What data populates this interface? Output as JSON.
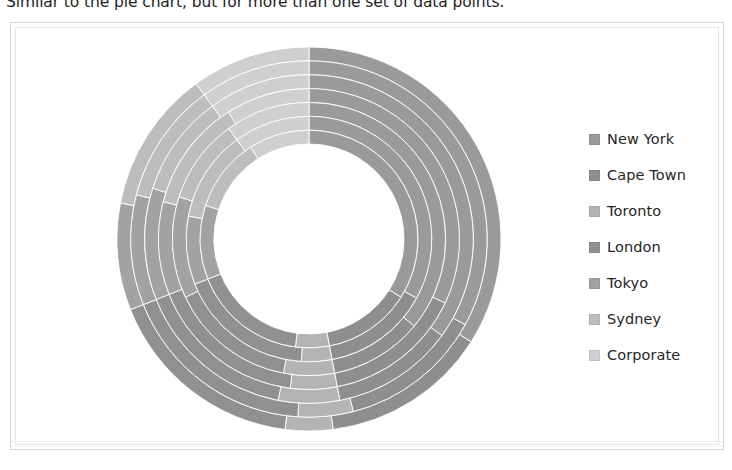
{
  "caption": {
    "text": "Similar to the pie chart, but for more than one set of data points."
  },
  "figure": {
    "frame_color": "#d8d8d8",
    "background": "#ffffff"
  },
  "legend": {
    "position": "right",
    "items": [
      {
        "label": "New York",
        "color": "#9a9a9a"
      },
      {
        "label": "Cape Town",
        "color": "#8e8e8e"
      },
      {
        "label": "Toronto",
        "color": "#b4b4b4"
      },
      {
        "label": "London",
        "color": "#909090"
      },
      {
        "label": "Tokyo",
        "color": "#a2a2a2"
      },
      {
        "label": "Sydney",
        "color": "#bdbdbd"
      },
      {
        "label": "Corporate",
        "color": "#cfcfcf"
      }
    ]
  },
  "chart_data": {
    "type": "pie",
    "subtype": "multi-ring-doughnut",
    "title": "",
    "xlabel": "",
    "ylabel": "",
    "grid": false,
    "legend_position": "right",
    "start_angle_deg": -90,
    "direction": "clockwise",
    "center": {
      "x": 200,
      "y": 200
    },
    "inner_radius": 95,
    "outer_radius": 192,
    "ring_count": 7,
    "categories": [
      "New York",
      "Cape Town",
      "Toronto",
      "London",
      "Tokyo",
      "Sydney",
      "Corporate"
    ],
    "colors": [
      "#9a9a9a",
      "#8e8e8e",
      "#b4b4b4",
      "#909090",
      "#a2a2a2",
      "#bdbdbd",
      "#cfcfcf"
    ],
    "rings": [
      {
        "name": "Ring 1 (outermost)",
        "r_inner": 0.865,
        "r_outer": 1.0,
        "values": [
          34,
          14,
          4,
          17,
          9,
          12,
          10
        ]
      },
      {
        "name": "Ring 2",
        "r_inner": 0.73,
        "r_outer": 0.865,
        "values": [
          33,
          13,
          5,
          18,
          10,
          11,
          10
        ]
      },
      {
        "name": "Ring 3",
        "r_inner": 0.595,
        "r_outer": 0.73,
        "values": [
          35,
          12,
          6,
          16,
          11,
          10,
          10
        ]
      },
      {
        "name": "Ring 4",
        "r_inner": 0.66,
        "r_outer": 0.595,
        "values": [
          32,
          15,
          5,
          17,
          10,
          12,
          9
        ]
      },
      {
        "name": "Ring 5",
        "r_inner": 0.595,
        "r_outer": 0.66,
        "values": [
          36,
          11,
          6,
          15,
          12,
          10,
          10
        ]
      },
      {
        "name": "Ring 6",
        "r_inner": 0.53,
        "r_outer": 0.595,
        "values": [
          33,
          14,
          4,
          18,
          9,
          12,
          10
        ]
      },
      {
        "name": "Ring 7 (innermost)",
        "r_inner": 0.495,
        "r_outer": 0.53,
        "values": [
          34,
          13,
          5,
          17,
          11,
          11,
          9
        ]
      }
    ]
  }
}
